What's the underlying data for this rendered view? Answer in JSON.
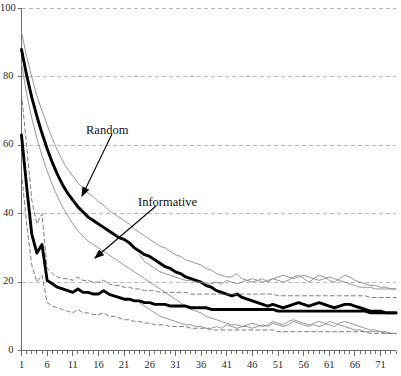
{
  "chart_data": {
    "type": "line",
    "title": "",
    "xlabel": "",
    "ylabel": "",
    "xlim": [
      1,
      74
    ],
    "ylim": [
      0,
      100
    ],
    "grid": true,
    "legend_position": "annotations-inline",
    "x_ticks": [
      "1",
      "6",
      "11",
      "16",
      "21",
      "26",
      "31",
      "36",
      "41",
      "46",
      "51",
      "56",
      "61",
      "66",
      "71"
    ],
    "x_tick_values": [
      1,
      6,
      11,
      16,
      21,
      26,
      31,
      36,
      41,
      46,
      51,
      56,
      61,
      66,
      71
    ],
    "y_ticks": [
      "0",
      "20",
      "40",
      "60",
      "80",
      "100"
    ],
    "y_tick_values": [
      0,
      20,
      40,
      60,
      80,
      100
    ],
    "annotations": [
      {
        "text": "Random",
        "text_x": 86,
        "text_y": 124,
        "arrow_from_x": 112,
        "arrow_from_y": 134,
        "arrow_to_x": 82,
        "arrow_to_y": 196
      },
      {
        "text": "Informative",
        "text_x": 138,
        "text_y": 196,
        "arrow_from_x": 156,
        "arrow_from_y": 206,
        "arrow_to_x": 95,
        "arrow_to_y": 258
      }
    ],
    "series": [
      {
        "name": "Random",
        "style": "thick-solid",
        "color": "#000000",
        "width": 2.9,
        "x": [
          1,
          2,
          3,
          4,
          5,
          6,
          7,
          8,
          9,
          10,
          11,
          12,
          13,
          14,
          15,
          16,
          17,
          18,
          19,
          20,
          21,
          22,
          23,
          24,
          25,
          26,
          27,
          28,
          29,
          30,
          31,
          32,
          33,
          34,
          35,
          36,
          37,
          38,
          39,
          40,
          41,
          42,
          43,
          44,
          45,
          46,
          47,
          48,
          49,
          50,
          51,
          52,
          53,
          54,
          55,
          56,
          57,
          58,
          59,
          60,
          61,
          62,
          63,
          64,
          65,
          66,
          67,
          68,
          69,
          70,
          71,
          72,
          73,
          74
        ],
        "values": [
          88.0,
          80.5,
          74.0,
          68.5,
          63.5,
          59.0,
          55.0,
          51.5,
          48.5,
          46.0,
          44.0,
          42.0,
          40.5,
          39.0,
          38.0,
          37.0,
          36.0,
          35.0,
          34.0,
          33.0,
          32.5,
          31.5,
          30.0,
          29.0,
          28.0,
          27.5,
          26.5,
          25.5,
          24.5,
          24.0,
          23.0,
          22.5,
          21.5,
          21.0,
          20.5,
          20.0,
          19.0,
          18.5,
          17.5,
          17.0,
          16.5,
          16.0,
          16.5,
          15.5,
          15.0,
          14.5,
          14.0,
          13.5,
          13.0,
          13.5,
          13.0,
          12.5,
          13.0,
          13.5,
          14.0,
          13.5,
          13.0,
          13.5,
          14.0,
          13.5,
          13.0,
          12.5,
          13.0,
          13.5,
          13.5,
          13.0,
          12.5,
          12.0,
          11.5,
          11.5,
          11.5,
          11.0,
          11.0,
          11.0
        ]
      },
      {
        "name": "Random upper band",
        "style": "thin-solid",
        "color": "#8a8a8a",
        "width": 0.9,
        "x": [
          1,
          2,
          3,
          4,
          5,
          6,
          7,
          8,
          9,
          10,
          11,
          12,
          13,
          14,
          15,
          16,
          17,
          18,
          19,
          20,
          21,
          22,
          23,
          24,
          25,
          26,
          27,
          28,
          29,
          30,
          31,
          32,
          33,
          34,
          35,
          36,
          37,
          38,
          39,
          40,
          41,
          42,
          43,
          44,
          45,
          46,
          47,
          48,
          49,
          50,
          51,
          52,
          53,
          54,
          55,
          56,
          57,
          58,
          59,
          60,
          61,
          62,
          63,
          64,
          65,
          66,
          67,
          68,
          69,
          70,
          71,
          72,
          73,
          74
        ],
        "values": [
          93.0,
          86.0,
          80.0,
          74.5,
          70.0,
          66.0,
          62.0,
          58.5,
          55.5,
          53.0,
          51.0,
          49.0,
          47.5,
          46.0,
          45.0,
          43.5,
          42.5,
          41.0,
          40.0,
          39.0,
          38.0,
          37.0,
          35.5,
          34.5,
          33.5,
          32.5,
          31.5,
          30.5,
          30.0,
          29.0,
          28.0,
          27.5,
          26.5,
          26.0,
          25.5,
          25.0,
          24.0,
          23.5,
          22.5,
          22.0,
          21.5,
          21.5,
          22.5,
          21.0,
          20.5,
          20.0,
          20.5,
          21.0,
          20.0,
          21.0,
          20.5,
          20.0,
          20.5,
          21.5,
          22.0,
          21.0,
          20.0,
          21.0,
          22.0,
          21.5,
          20.5,
          20.0,
          21.0,
          22.0,
          21.5,
          20.5,
          20.0,
          19.5,
          19.0,
          19.0,
          18.5,
          18.5,
          18.0,
          18.0
        ]
      },
      {
        "name": "Random lower band",
        "style": "thin-solid",
        "color": "#8a8a8a",
        "width": 0.9,
        "x": [
          1,
          2,
          3,
          4,
          5,
          6,
          7,
          8,
          9,
          10,
          11,
          12,
          13,
          14,
          15,
          16,
          17,
          18,
          19,
          20,
          21,
          22,
          23,
          24,
          25,
          26,
          27,
          28,
          29,
          30,
          31,
          32,
          33,
          34,
          35,
          36,
          37,
          38,
          39,
          40,
          41,
          42,
          43,
          44,
          45,
          46,
          47,
          48,
          49,
          50,
          51,
          52,
          53,
          54,
          55,
          56,
          57,
          58,
          59,
          60,
          61,
          62,
          63,
          64,
          65,
          66,
          67,
          68,
          69,
          70,
          71,
          72,
          73,
          74
        ],
        "values": [
          84.0,
          75.0,
          68.0,
          62.0,
          57.0,
          52.5,
          48.5,
          45.0,
          42.0,
          39.5,
          37.0,
          35.0,
          33.5,
          32.0,
          31.0,
          30.0,
          29.0,
          28.0,
          27.0,
          26.0,
          25.0,
          24.0,
          23.0,
          22.0,
          21.0,
          20.0,
          19.0,
          18.0,
          17.0,
          16.0,
          15.0,
          14.0,
          13.0,
          12.0,
          11.5,
          11.0,
          10.0,
          9.5,
          9.0,
          8.5,
          8.0,
          7.5,
          7.5,
          7.0,
          7.0,
          6.5,
          7.0,
          7.5,
          7.0,
          8.0,
          7.5,
          7.0,
          7.5,
          8.5,
          8.0,
          7.5,
          7.0,
          8.0,
          8.5,
          8.0,
          7.5,
          7.0,
          8.0,
          8.5,
          8.0,
          7.5,
          7.0,
          6.5,
          6.0,
          6.0,
          5.5,
          5.5,
          5.0,
          5.0
        ]
      },
      {
        "name": "Informative",
        "style": "thick-solid",
        "color": "#000000",
        "width": 2.9,
        "x": [
          1,
          2,
          3,
          4,
          5,
          6,
          7,
          8,
          9,
          10,
          11,
          12,
          13,
          14,
          15,
          16,
          17,
          18,
          19,
          20,
          21,
          22,
          23,
          24,
          25,
          26,
          27,
          28,
          29,
          30,
          31,
          32,
          33,
          34,
          35,
          36,
          37,
          38,
          39,
          40,
          41,
          42,
          43,
          44,
          45,
          46,
          47,
          48,
          49,
          50,
          51,
          52,
          53,
          54,
          55,
          56,
          57,
          58,
          59,
          60,
          61,
          62,
          63,
          64,
          65,
          66,
          67,
          68,
          69,
          70,
          71,
          72,
          73,
          74
        ],
        "values": [
          63.0,
          48.0,
          34.0,
          28.5,
          31.0,
          20.5,
          19.5,
          18.5,
          18.0,
          17.5,
          17.0,
          18.0,
          17.0,
          17.0,
          16.5,
          16.5,
          17.5,
          16.5,
          16.0,
          15.5,
          15.0,
          15.0,
          14.5,
          14.5,
          14.0,
          14.0,
          13.5,
          13.5,
          13.5,
          13.0,
          13.0,
          13.0,
          13.0,
          12.5,
          12.5,
          12.5,
          12.5,
          12.0,
          12.0,
          12.0,
          12.0,
          12.0,
          12.0,
          12.0,
          12.0,
          12.0,
          12.0,
          12.0,
          12.0,
          12.0,
          11.5,
          11.5,
          11.5,
          11.5,
          11.5,
          11.5,
          11.5,
          11.5,
          11.5,
          11.5,
          11.5,
          11.5,
          11.5,
          11.5,
          11.5,
          11.5,
          11.5,
          11.5,
          11.0,
          11.0,
          11.0,
          11.0,
          11.0,
          11.0
        ]
      },
      {
        "name": "Informative upper band",
        "style": "dashed",
        "color": "#6e6e6e",
        "width": 0.9,
        "x": [
          1,
          2,
          3,
          4,
          5,
          6,
          7,
          8,
          9,
          10,
          11,
          12,
          13,
          14,
          15,
          16,
          17,
          18,
          19,
          20,
          21,
          22,
          23,
          24,
          25,
          26,
          27,
          28,
          29,
          30,
          31,
          32,
          33,
          34,
          35,
          36,
          37,
          38,
          39,
          40,
          41,
          42,
          43,
          44,
          45,
          46,
          47,
          48,
          49,
          50,
          51,
          52,
          53,
          54,
          55,
          56,
          57,
          58,
          59,
          60,
          61,
          62,
          63,
          64,
          65,
          66,
          67,
          68,
          69,
          70,
          71,
          72,
          73,
          74
        ],
        "values": [
          75.0,
          60.0,
          44.0,
          37.0,
          40.0,
          24.0,
          22.5,
          21.5,
          21.0,
          21.0,
          20.5,
          21.5,
          20.5,
          20.5,
          20.0,
          20.0,
          20.5,
          19.5,
          19.0,
          19.0,
          18.5,
          18.5,
          18.0,
          18.0,
          17.5,
          17.5,
          17.5,
          17.0,
          17.0,
          17.0,
          17.0,
          17.0,
          17.0,
          16.5,
          16.5,
          16.5,
          16.5,
          16.5,
          16.5,
          16.5,
          16.5,
          16.5,
          16.5,
          16.5,
          16.5,
          16.5,
          16.5,
          16.5,
          16.5,
          16.5,
          16.0,
          16.0,
          16.0,
          16.0,
          16.0,
          16.0,
          16.0,
          16.0,
          16.0,
          16.0,
          16.0,
          16.0,
          16.0,
          16.0,
          16.0,
          16.0,
          16.0,
          16.0,
          15.5,
          15.5,
          15.5,
          15.5,
          15.5,
          15.5
        ]
      },
      {
        "name": "Informative lower band",
        "style": "dashed",
        "color": "#6e6e6e",
        "width": 0.9,
        "x": [
          1,
          2,
          3,
          4,
          5,
          6,
          7,
          8,
          9,
          10,
          11,
          12,
          13,
          14,
          15,
          16,
          17,
          18,
          19,
          20,
          21,
          22,
          23,
          24,
          25,
          26,
          27,
          28,
          29,
          30,
          31,
          32,
          33,
          34,
          35,
          36,
          37,
          38,
          39,
          40,
          41,
          42,
          43,
          44,
          45,
          46,
          47,
          48,
          49,
          50,
          51,
          52,
          53,
          54,
          55,
          56,
          57,
          58,
          59,
          60,
          61,
          62,
          63,
          64,
          65,
          66,
          67,
          68,
          69,
          70,
          71,
          72,
          73,
          74
        ],
        "values": [
          52.0,
          37.0,
          25.0,
          20.0,
          22.0,
          14.0,
          13.0,
          12.5,
          12.0,
          11.5,
          11.0,
          12.0,
          11.0,
          11.0,
          10.5,
          10.5,
          11.0,
          10.0,
          10.0,
          9.5,
          9.0,
          9.0,
          8.5,
          8.5,
          8.0,
          8.0,
          7.5,
          7.5,
          7.5,
          7.0,
          7.0,
          7.0,
          7.0,
          6.5,
          6.5,
          6.5,
          6.5,
          6.0,
          6.0,
          6.0,
          6.0,
          6.0,
          6.0,
          6.0,
          6.0,
          6.0,
          6.0,
          6.0,
          6.0,
          6.0,
          5.5,
          5.5,
          5.5,
          5.5,
          5.5,
          5.5,
          5.5,
          5.5,
          5.5,
          5.5,
          5.5,
          5.5,
          5.5,
          5.5,
          5.5,
          5.5,
          5.5,
          5.5,
          5.0,
          5.0,
          5.0,
          5.0,
          5.0,
          5.0
        ]
      },
      {
        "name": "Informative noisy upper",
        "style": "thin-solid",
        "color": "#8a8a8a",
        "width": 0.9,
        "x": [
          24,
          25,
          26,
          27,
          28,
          29,
          30,
          31,
          32,
          33,
          34,
          35,
          36,
          37,
          38,
          39,
          40,
          41,
          42,
          43,
          44,
          45,
          46,
          47,
          48,
          49,
          50,
          51,
          52,
          53,
          54,
          55,
          56,
          57,
          58,
          59,
          60,
          61,
          62,
          63,
          64,
          65,
          66,
          67,
          68,
          69,
          70,
          71,
          72,
          73,
          74
        ],
        "values": [
          28.0,
          26.0,
          25.0,
          24.0,
          23.0,
          22.5,
          22.0,
          21.5,
          21.0,
          20.5,
          20.5,
          20.0,
          20.0,
          19.5,
          19.5,
          20.0,
          19.5,
          20.5,
          20.0,
          19.5,
          20.0,
          20.5,
          21.0,
          20.5,
          20.0,
          20.5,
          21.0,
          21.5,
          22.0,
          21.5,
          21.0,
          21.5,
          22.0,
          21.5,
          21.0,
          20.5,
          21.0,
          21.5,
          21.0,
          20.5,
          20.0,
          19.5,
          19.0,
          18.5,
          18.5,
          18.5,
          18.0,
          18.0,
          18.0,
          18.0,
          18.0
        ]
      },
      {
        "name": "Informative noisy lower",
        "style": "thin-solid",
        "color": "#8a8a8a",
        "width": 0.9,
        "x": [
          24,
          25,
          26,
          27,
          28,
          29,
          30,
          31,
          32,
          33,
          34,
          35,
          36,
          37,
          38,
          39,
          40,
          41,
          42,
          43,
          44,
          45,
          46,
          47,
          48,
          49,
          50,
          51,
          52,
          53,
          54,
          55,
          56,
          57,
          58,
          59,
          60,
          61,
          62,
          63,
          64,
          65,
          66,
          67,
          68,
          69,
          70,
          71,
          72,
          73,
          74
        ],
        "values": [
          14.0,
          13.0,
          12.0,
          11.0,
          10.0,
          9.5,
          9.0,
          8.5,
          8.0,
          7.5,
          7.5,
          7.0,
          7.0,
          6.5,
          6.5,
          7.0,
          6.5,
          7.5,
          7.0,
          6.5,
          7.0,
          7.5,
          8.0,
          7.5,
          7.0,
          7.5,
          8.5,
          8.0,
          7.5,
          8.5,
          9.0,
          8.5,
          8.0,
          7.5,
          7.5,
          7.0,
          7.5,
          8.5,
          8.0,
          7.5,
          7.0,
          6.5,
          6.0,
          6.0,
          5.5,
          5.5,
          5.5,
          5.5,
          5.0,
          5.0,
          5.0
        ]
      }
    ]
  }
}
